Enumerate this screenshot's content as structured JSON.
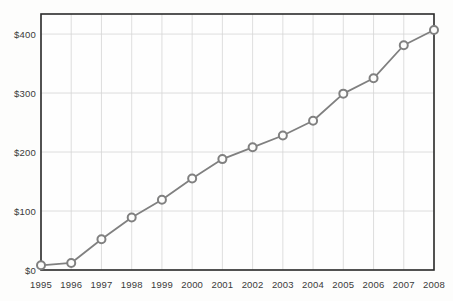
{
  "chart_data": {
    "type": "line",
    "title": "",
    "subtitle": "",
    "xlabel": "",
    "ylabel": "",
    "categories": [
      "1995",
      "1996",
      "1997",
      "1998",
      "1999",
      "2000",
      "2001",
      "2002",
      "2003",
      "2004",
      "2005",
      "2006",
      "2007",
      "2008"
    ],
    "values": [
      8,
      12,
      52,
      89,
      119,
      155,
      188,
      208,
      228,
      253,
      299,
      325,
      381,
      407
    ],
    "series": [
      {
        "name": "",
        "values": [
          8,
          12,
          52,
          89,
          119,
          155,
          188,
          208,
          228,
          253,
          299,
          325,
          381,
          407
        ]
      }
    ],
    "x_tick_labels": [
      "1995",
      "1996",
      "1997",
      "1998",
      "1999",
      "2000",
      "2001",
      "2002",
      "2003",
      "2004",
      "2005",
      "2006",
      "2007",
      "2008"
    ],
    "y_tick_labels": [
      "$0",
      "$100",
      "$200",
      "$300",
      "$400"
    ],
    "y_tick_values": [
      0,
      100,
      200,
      300,
      400
    ],
    "ylim": [
      0,
      434
    ],
    "xlim": [
      1995,
      2008
    ],
    "grid": true,
    "grid_axis": "both",
    "legend": false,
    "legend_position": "none",
    "marker": "open-circle",
    "annotations": []
  },
  "style": {
    "line_color": "#808080",
    "marker_stroke_color": "#808080",
    "marker_fill_color": "#fdfdfc",
    "grid_color": "#d5d5d5",
    "frame_color": "#2b2b2b",
    "tick_label_color": "#3a3a3a",
    "background_color": "#fdfdfc",
    "plot_background_color": "#fefefe"
  }
}
